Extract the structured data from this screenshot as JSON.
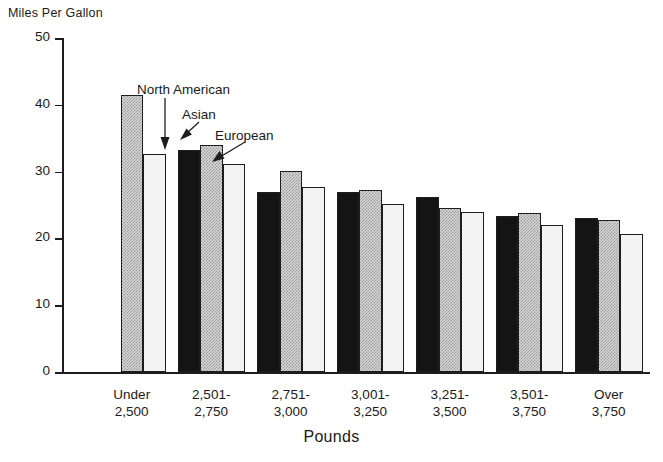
{
  "chart_data": {
    "type": "bar",
    "title": "",
    "ylabel": "Miles Per Gallon",
    "xlabel": "Pounds",
    "ylim": [
      0,
      50
    ],
    "yticks": [
      0,
      10,
      20,
      30,
      40,
      50
    ],
    "grid": false,
    "legend_position": "inline-annotations",
    "categories": [
      "Under 2,500",
      "2,501-2,750",
      "2,751-3,000",
      "3,001-3,250",
      "3,251-3,500",
      "3,501-3,750",
      "Over 3,750"
    ],
    "category_lines": [
      [
        "Under",
        "2,500"
      ],
      [
        "2,501-",
        "2,750"
      ],
      [
        "2,751-",
        "3,000"
      ],
      [
        "3,001-",
        "3,250"
      ],
      [
        "3,251-",
        "3,500"
      ],
      [
        "3,501-",
        "3,750"
      ],
      [
        "Over",
        "3,750"
      ]
    ],
    "series": [
      {
        "name": "North American",
        "fill": "solid-black",
        "color": "#141414",
        "values": [
          null,
          33.2,
          27.0,
          26.9,
          26.2,
          23.3,
          23.0
        ]
      },
      {
        "name": "Asian",
        "fill": "checker-gray",
        "color": "#d8d8d8",
        "values": [
          41.5,
          34.0,
          30.1,
          27.3,
          24.5,
          23.8,
          22.7
        ]
      },
      {
        "name": "European",
        "fill": "dotted-light",
        "color": "#f3f3f3",
        "values": [
          32.6,
          31.2,
          27.7,
          25.2,
          24.0,
          22.0,
          20.7
        ]
      }
    ],
    "annotations": [
      {
        "text": "North American",
        "target_group": "2,501-2,750",
        "target_series": "North American"
      },
      {
        "text": "Asian",
        "target_group": "2,501-2,750",
        "target_series": "Asian"
      },
      {
        "text": "European",
        "target_group": "2,501-2,750",
        "target_series": "European"
      }
    ]
  }
}
